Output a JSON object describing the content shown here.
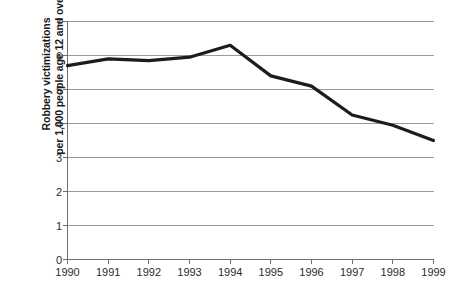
{
  "chart_data": {
    "type": "line",
    "title": "",
    "subtitle": "",
    "xlabel": "",
    "ylabel": "Robbery victimizations per 1,000 people age 12 and over",
    "ylabel_lines": [
      "Robbery victimizations",
      "per 1,000 people age 12 and over"
    ],
    "categories": [
      "1990",
      "1991",
      "1992",
      "1993",
      "1994",
      "1995",
      "1996",
      "1997",
      "1998",
      "1999"
    ],
    "x": [
      1990,
      1991,
      1992,
      1993,
      1994,
      1995,
      1996,
      1997,
      1998,
      1999
    ],
    "values": [
      5.7,
      5.9,
      5.85,
      5.95,
      6.3,
      5.4,
      5.1,
      4.25,
      3.95,
      3.5
    ],
    "series": [
      {
        "name": "Robbery victimization rate",
        "values": [
          5.7,
          5.9,
          5.85,
          5.95,
          6.3,
          5.4,
          5.1,
          4.25,
          3.95,
          3.5
        ],
        "color": "#1c1c1c"
      }
    ],
    "ylim": [
      0,
      7
    ],
    "yticks": [
      0,
      1,
      2,
      3,
      4,
      5,
      6,
      7
    ],
    "ytick_labels": [
      "0",
      "1",
      "2",
      "3",
      "4",
      "5",
      "6",
      "7"
    ],
    "xlim": [
      1990,
      1999
    ],
    "xticks": [
      1990,
      1991,
      1992,
      1993,
      1994,
      1995,
      1996,
      1997,
      1998,
      1999
    ],
    "xtick_labels": [
      "1990",
      "1991",
      "1992",
      "1993",
      "1994",
      "1995",
      "1996",
      "1997",
      "1998",
      "1999"
    ],
    "grid": true,
    "grid_axis": "y",
    "legend": false,
    "legend_position": "none",
    "annotations": [],
    "colors": {
      "line": "#1c1c1c",
      "grid": "#9a9a9a",
      "axis": "#6f6f6f",
      "text": "#2b2b2b",
      "background": "#ffffff"
    }
  }
}
